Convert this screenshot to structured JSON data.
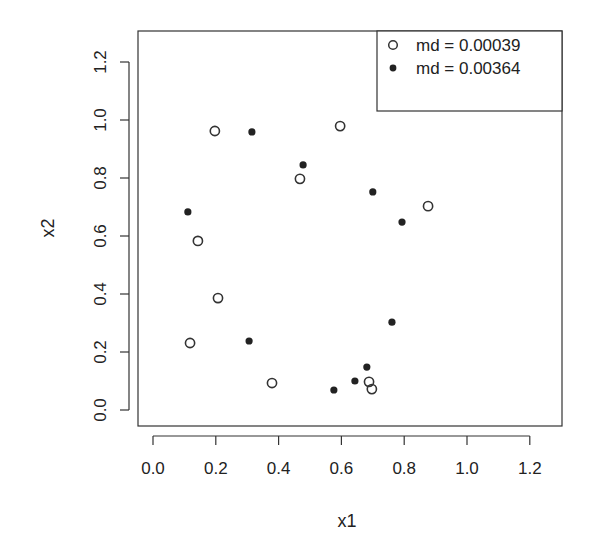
{
  "chart_data": {
    "type": "scatter",
    "title": "",
    "xlabel": "x1",
    "ylabel": "x2",
    "xlim": [
      -0.05,
      1.3
    ],
    "ylim": [
      -0.05,
      1.3
    ],
    "xticks": [
      "0.0",
      "0.2",
      "0.4",
      "0.6",
      "0.8",
      "1.0",
      "1.2"
    ],
    "yticks": [
      "0.0",
      "0.2",
      "0.4",
      "0.6",
      "0.8",
      "1.0",
      "1.2"
    ],
    "grid": false,
    "legend_position": "topright",
    "series": [
      {
        "name": "md = 0.00039",
        "marker": "open-circle",
        "color": "#333333",
        "points": [
          [
            0.197,
            0.962
          ],
          [
            0.596,
            0.979
          ],
          [
            0.468,
            0.797
          ],
          [
            0.876,
            0.703
          ],
          [
            0.143,
            0.583
          ],
          [
            0.207,
            0.386
          ],
          [
            0.118,
            0.231
          ],
          [
            0.379,
            0.093
          ],
          [
            0.688,
            0.097
          ],
          [
            0.697,
            0.072
          ]
        ]
      },
      {
        "name": "md = 0.00364",
        "marker": "filled-circle",
        "color": "#222222",
        "points": [
          [
            0.315,
            0.959
          ],
          [
            0.478,
            0.845
          ],
          [
            0.7,
            0.752
          ],
          [
            0.793,
            0.648
          ],
          [
            0.111,
            0.683
          ],
          [
            0.306,
            0.238
          ],
          [
            0.761,
            0.303
          ],
          [
            0.681,
            0.148
          ],
          [
            0.643,
            0.1
          ],
          [
            0.576,
            0.069
          ]
        ]
      }
    ]
  }
}
